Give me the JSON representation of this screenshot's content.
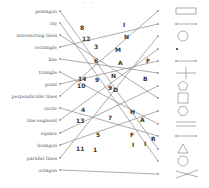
{
  "header": {
    "text": "— · —"
  },
  "terms": [
    {
      "label": "pentagon",
      "y": 11
    },
    {
      "label": "ray",
      "y": 23
    },
    {
      "label": "intersecting lines",
      "y": 35
    },
    {
      "label": "rectangle",
      "y": 47
    },
    {
      "label": "line",
      "y": 59
    },
    {
      "label": "triangle",
      "y": 72
    },
    {
      "label": "point",
      "y": 84
    },
    {
      "label": "perpendicular lines",
      "y": 96
    },
    {
      "label": "circle",
      "y": 108
    },
    {
      "label": "line segment",
      "y": 120
    },
    {
      "label": "square",
      "y": 133
    },
    {
      "label": "hexagon",
      "y": 145
    },
    {
      "label": "parallel lines",
      "y": 158
    },
    {
      "label": "octagon",
      "y": 170
    }
  ],
  "shapes": [
    {
      "name": "rectangle-shape",
      "y": 11
    },
    {
      "name": "line-segment-shape",
      "y": 24
    },
    {
      "name": "circle-shape",
      "y": 36
    },
    {
      "name": "point-shape",
      "y": 49
    },
    {
      "name": "line-shape",
      "y": 61
    },
    {
      "name": "perpendicular-lines-shape",
      "y": 73
    },
    {
      "name": "pentagon-shape",
      "y": 86
    },
    {
      "name": "square-shape",
      "y": 98
    },
    {
      "name": "hexagon-shape",
      "y": 111
    },
    {
      "name": "parallel-lines-shape",
      "y": 124
    },
    {
      "name": "line-segment-2-shape",
      "y": 136
    },
    {
      "name": "triangle-shape",
      "y": 149
    },
    {
      "name": "circle-2-shape",
      "y": 161
    },
    {
      "name": "intersecting-lines-shape",
      "y": 174
    }
  ],
  "connectors": [
    {
      "from": 0,
      "to": 11
    },
    {
      "from": 1,
      "to": 12
    },
    {
      "from": 2,
      "to": 7
    },
    {
      "from": 3,
      "to": 1
    },
    {
      "from": 4,
      "to": 5
    },
    {
      "from": 5,
      "to": 9
    },
    {
      "from": 6,
      "to": 4
    },
    {
      "from": 7,
      "to": 0
    },
    {
      "from": 8,
      "to": 10
    },
    {
      "from": 9,
      "to": 3
    },
    {
      "from": 10,
      "to": 6
    },
    {
      "from": 11,
      "to": 8
    },
    {
      "from": 12,
      "to": 2
    },
    {
      "from": 13,
      "to": 13
    }
  ],
  "labels": [
    {
      "text": "8",
      "x": 80,
      "y": 30
    },
    {
      "text": "12",
      "x": 82,
      "y": 41
    },
    {
      "text": "3",
      "x": 94,
      "y": 49
    },
    {
      "text": "6",
      "x": 94,
      "y": 63
    },
    {
      "text": "14",
      "x": 78,
      "y": 81
    },
    {
      "text": "10",
      "x": 77,
      "y": 88
    },
    {
      "text": "9",
      "x": 95,
      "y": 82
    },
    {
      "text": "9",
      "x": 108,
      "y": 90
    },
    {
      "text": "4",
      "x": 81,
      "y": 112
    },
    {
      "text": "13",
      "x": 76,
      "y": 123
    },
    {
      "text": "7",
      "x": 108,
      "y": 120
    },
    {
      "text": "5",
      "x": 96,
      "y": 137
    },
    {
      "text": "11",
      "x": 76,
      "y": 151
    },
    {
      "text": "1",
      "x": 93,
      "y": 152
    },
    {
      "text": "I",
      "x": 123,
      "y": 27
    },
    {
      "text": "N",
      "x": 124,
      "y": 39
    },
    {
      "text": "M",
      "x": 115,
      "y": 52
    },
    {
      "text": "A",
      "x": 118,
      "y": 65
    },
    {
      "text": "F",
      "x": 146,
      "y": 63
    },
    {
      "text": "N",
      "x": 111,
      "y": 78
    },
    {
      "text": "B",
      "x": 143,
      "y": 81
    },
    {
      "text": "D",
      "x": 113,
      "y": 92
    },
    {
      "text": "H",
      "x": 130,
      "y": 114
    },
    {
      "text": "A",
      "x": 140,
      "y": 122
    },
    {
      "text": "F",
      "x": 130,
      "y": 137
    },
    {
      "text": "R",
      "x": 151,
      "y": 141
    },
    {
      "text": "I",
      "x": 132,
      "y": 147
    },
    {
      "text": "I",
      "x": 144,
      "y": 146
    }
  ],
  "colors": {
    "line": "#8a8a8a",
    "label": "#333333",
    "term": "#555555",
    "shape": "#777777"
  }
}
